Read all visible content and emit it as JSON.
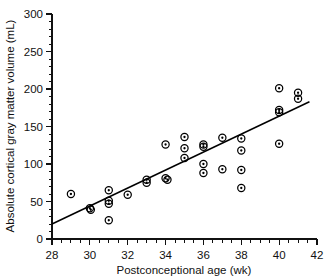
{
  "chart_data": {
    "type": "scatter",
    "title": "",
    "xlabel": "Postconceptional age (wk)",
    "ylabel": "Absolute cortical gray matter volume (mL)",
    "xlim": [
      28,
      42
    ],
    "ylim": [
      0,
      300
    ],
    "xticks": [
      28,
      30,
      32,
      34,
      36,
      38,
      40,
      42
    ],
    "yticks": [
      0,
      50,
      100,
      150,
      200,
      250,
      300
    ],
    "xtick_labels": [
      "28",
      "30",
      "32",
      "34",
      "36",
      "38",
      "40",
      "42"
    ],
    "ytick_labels": [
      "0",
      "50",
      "100",
      "150",
      "200",
      "250",
      "300"
    ],
    "x_minor_step": 0.5,
    "y_minor_step": 10,
    "grid": false,
    "legend": false,
    "marker": "circle-with-dot",
    "points": [
      {
        "x": 29.0,
        "y": 60
      },
      {
        "x": 30.0,
        "y": 41
      },
      {
        "x": 30.05,
        "y": 39
      },
      {
        "x": 31.0,
        "y": 65
      },
      {
        "x": 31.0,
        "y": 51
      },
      {
        "x": 31.0,
        "y": 47
      },
      {
        "x": 31.0,
        "y": 25
      },
      {
        "x": 32.0,
        "y": 59
      },
      {
        "x": 33.0,
        "y": 79
      },
      {
        "x": 33.0,
        "y": 75
      },
      {
        "x": 34.0,
        "y": 126
      },
      {
        "x": 34.0,
        "y": 81
      },
      {
        "x": 34.1,
        "y": 79
      },
      {
        "x": 35.0,
        "y": 136
      },
      {
        "x": 35.0,
        "y": 121
      },
      {
        "x": 35.0,
        "y": 108
      },
      {
        "x": 36.0,
        "y": 126
      },
      {
        "x": 36.0,
        "y": 123
      },
      {
        "x": 36.0,
        "y": 100
      },
      {
        "x": 36.0,
        "y": 88
      },
      {
        "x": 37.0,
        "y": 135
      },
      {
        "x": 37.0,
        "y": 93
      },
      {
        "x": 38.0,
        "y": 134
      },
      {
        "x": 38.0,
        "y": 118
      },
      {
        "x": 38.0,
        "y": 92
      },
      {
        "x": 38.0,
        "y": 68
      },
      {
        "x": 40.0,
        "y": 201
      },
      {
        "x": 40.0,
        "y": 172
      },
      {
        "x": 40.0,
        "y": 169
      },
      {
        "x": 40.0,
        "y": 127
      },
      {
        "x": 41.0,
        "y": 195
      },
      {
        "x": 41.0,
        "y": 187
      }
    ],
    "fit_line": {
      "label": "regression line",
      "x_start": 28.0,
      "y_start": 20,
      "x_end": 41.6,
      "y_end": 183
    }
  }
}
